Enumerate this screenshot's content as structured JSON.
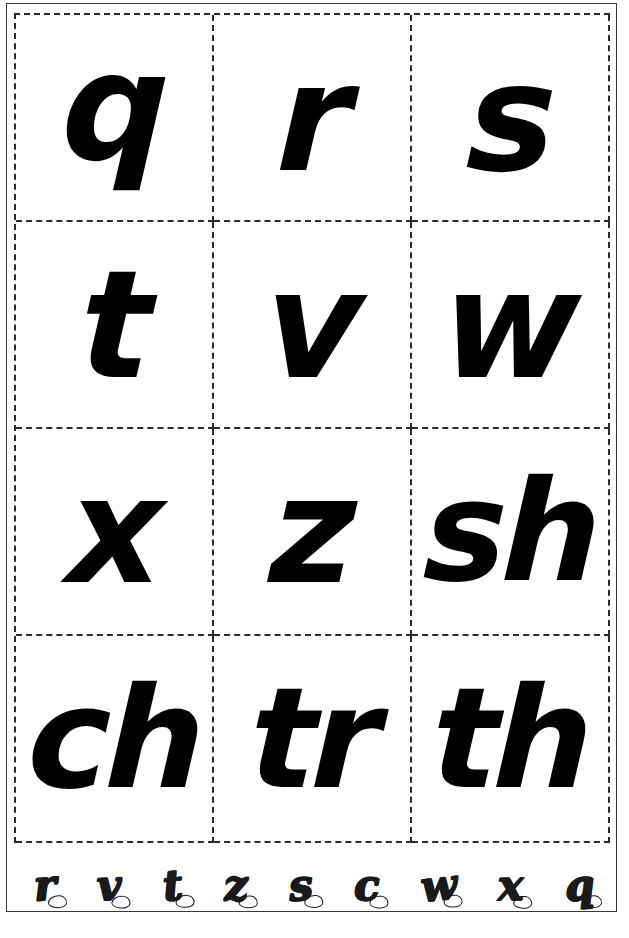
{
  "page": {
    "background_color": "#ffffff",
    "frame_color": "#3a3a3a",
    "cut_line_color": "#2b2b2b",
    "glyph_color": "#000000"
  },
  "card_grid": {
    "columns": 3,
    "rows": 4,
    "cut_line_style": "dashed",
    "cards": [
      {
        "row": 1,
        "column": 1,
        "text": "q",
        "type": "letter"
      },
      {
        "row": 1,
        "column": 2,
        "text": "r",
        "type": "letter"
      },
      {
        "row": 1,
        "column": 3,
        "text": "s",
        "type": "letter"
      },
      {
        "row": 2,
        "column": 1,
        "text": "t",
        "type": "letter"
      },
      {
        "row": 2,
        "column": 2,
        "text": "v",
        "type": "letter"
      },
      {
        "row": 2,
        "column": 3,
        "text": "w",
        "type": "letter"
      },
      {
        "row": 3,
        "column": 1,
        "text": "x",
        "type": "letter"
      },
      {
        "row": 3,
        "column": 2,
        "text": "z",
        "type": "letter"
      },
      {
        "row": 3,
        "column": 3,
        "text": "sh",
        "type": "digraph"
      },
      {
        "row": 4,
        "column": 1,
        "text": "ch",
        "type": "digraph"
      },
      {
        "row": 4,
        "column": 2,
        "text": "tr",
        "type": "digraph"
      },
      {
        "row": 4,
        "column": 3,
        "text": "th",
        "type": "digraph"
      }
    ]
  },
  "outline_strip": {
    "style": "hand-drawn outline letters",
    "letters": [
      {
        "text": "r"
      },
      {
        "text": "v"
      },
      {
        "text": "t"
      },
      {
        "text": "z"
      },
      {
        "text": "s"
      },
      {
        "text": "c"
      },
      {
        "text": "w"
      },
      {
        "text": "x"
      },
      {
        "text": "q"
      }
    ]
  }
}
